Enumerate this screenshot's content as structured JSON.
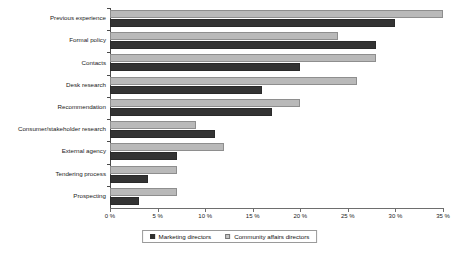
{
  "chart_data": {
    "type": "bar",
    "orientation": "horizontal",
    "title": "",
    "xlabel": "",
    "ylabel": "",
    "xlim": [
      0,
      35
    ],
    "grid": false,
    "legend_position": "bottom",
    "categories": [
      "Previous experience",
      "Formal policy",
      "Contacts",
      "Desk research",
      "Recommendation",
      "Consumer/stakeholder research",
      "External agency",
      "Tendering process",
      "Prospecting"
    ],
    "tick_labels": [
      "0 %",
      "5 %",
      "10 %",
      "15 %",
      "20 %",
      "25 %",
      "30 %",
      "35 %"
    ],
    "tick_values": [
      0,
      5,
      10,
      15,
      20,
      25,
      30,
      35
    ],
    "series": [
      {
        "name": "Marketing directors",
        "color": "#333333",
        "values": [
          30,
          28,
          20,
          16,
          17,
          11,
          7,
          4,
          3
        ]
      },
      {
        "name": "Community affairs directors",
        "color": "#b9b9b9",
        "values": [
          35,
          24,
          28,
          26,
          20,
          9,
          12,
          7,
          7
        ]
      }
    ]
  }
}
